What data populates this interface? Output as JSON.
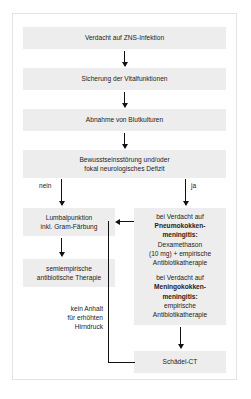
{
  "diagram": {
    "colors": {
      "box_fill": "#ededed",
      "line": "#111111",
      "frame_border": "#e3e3e3",
      "background": "#ffffff",
      "text": "#1d1d1d"
    }
  },
  "nodes": {
    "suspicion": {
      "line1": "Verdacht auf ZNS-Infektion"
    },
    "vitals": {
      "line1": "Sicherung der Vitalfunktionen"
    },
    "blood_cultures": {
      "line1": "Abnahme von Blutkulturen"
    },
    "consciousness": {
      "line1": "Bewusstseinsstörung und/oder",
      "line2": "fokal neurologisches Defizit"
    },
    "lumbar_puncture": {
      "line1": "Lumbalpunktion",
      "line2": "inkl. Gram-Färbung"
    },
    "semiempiric_therapy": {
      "line1": "semiempirische",
      "line2": "antibiotische Therapie"
    },
    "suspected_pathogens": {
      "pneumo_lead": "bei Verdacht auf",
      "pneumo_name_line1": "Pneumokokken-",
      "pneumo_name_line2": "meningitis:",
      "pneumo_tx_line1": "Dexamethason",
      "pneumo_tx_line2": "(10 mg) + empirische",
      "pneumo_tx_line3": "Antibiotikatherapie",
      "mening_lead": "bei Verdacht auf",
      "mening_name_line1": "Meningokokken-",
      "mening_name_line2": "meningitis:",
      "mening_tx_line1": "empirische",
      "mening_tx_line2": "Antibiotikatherapie"
    },
    "head_ct": {
      "line1": "Schädel-CT"
    }
  },
  "edges": {
    "branch_no": "nein",
    "branch_yes": "ja",
    "feedback_note_line1": "kein Anhalt",
    "feedback_note_line2": "für erhöhten",
    "feedback_note_line3": "Hirndruck"
  }
}
